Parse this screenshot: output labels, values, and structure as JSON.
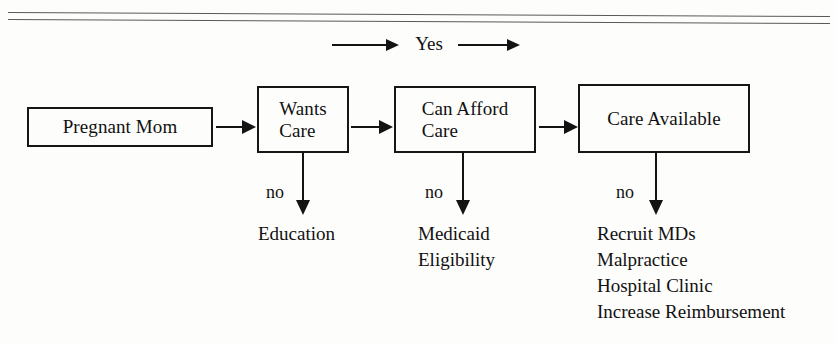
{
  "diagram": {
    "title_row": {
      "yes_label": "Yes",
      "left_arrow": "arrow-right-icon",
      "right_arrow": "arrow-right-icon"
    },
    "nodes": [
      {
        "id": "pregnant-mom",
        "label": "Pregnant Mom"
      },
      {
        "id": "wants-care",
        "label": "Wants\nCare"
      },
      {
        "id": "can-afford",
        "label": "Can Afford\nCare"
      },
      {
        "id": "care-available",
        "label": "Care Available"
      }
    ],
    "connectors": [
      {
        "id": "mom-to-wants",
        "icon": "arrow-right-icon"
      },
      {
        "id": "wants-to-afford",
        "icon": "arrow-right-icon"
      },
      {
        "id": "afford-to-avail",
        "icon": "arrow-right-icon"
      }
    ],
    "branches": [
      {
        "id": "wants-care-no",
        "no_label": "no",
        "arrow_icon": "arrow-down-icon",
        "outcome": "Education"
      },
      {
        "id": "can-afford-no",
        "no_label": "no",
        "arrow_icon": "arrow-down-icon",
        "outcome": "Medicaid\nEligibility"
      },
      {
        "id": "care-available-no",
        "no_label": "no",
        "arrow_icon": "arrow-down-icon",
        "outcome": "Recruit MDs\nMalpractice\nHospital Clinic\nIncrease Reimbursement"
      }
    ],
    "colors": {
      "ink": "#131313",
      "rule": "#5a5a5a",
      "background": "#fdfdfc"
    }
  }
}
